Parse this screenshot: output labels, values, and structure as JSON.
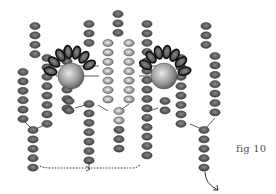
{
  "figure": {
    "caption": "fig 10",
    "caption_pos": {
      "x": 236,
      "y": 143
    },
    "colors": {
      "bead_dark_center": "#8a8a8a",
      "bead_dark_edge": "#3a3a3a",
      "bead_light_center": "#f2f2f2",
      "bead_light_edge": "#6e6e6e",
      "petal_outline": "#111111",
      "thread": "#333333",
      "background": "#ffffff"
    },
    "bead_size": {
      "rx": 5.2,
      "ry": 3.6
    },
    "columns": [
      {
        "name": "left-outer-column",
        "x": 23,
        "y_start": 72,
        "count": 6,
        "tone": "dark"
      },
      {
        "name": "left-top-column",
        "x": 35,
        "y_start": 26,
        "count": 4,
        "tone": "dark"
      },
      {
        "name": "left-inner-column",
        "x": 47,
        "y_start": 58,
        "count": 8,
        "tone": "dark"
      },
      {
        "name": "left-stem",
        "x": 33,
        "y_start": 130,
        "count": 5,
        "tone": "dark"
      },
      {
        "name": "left-mid-column",
        "x": 67,
        "y_start": 52,
        "count": 7,
        "tone": "dark"
      },
      {
        "name": "left-mid-stem",
        "x": 89,
        "y_start": 104,
        "count": 7,
        "tone": "dark"
      },
      {
        "name": "left-drop-under-bead",
        "x": 69,
        "y_start": 101,
        "count": 2,
        "tone": "dark"
      },
      {
        "name": "center-left-top-column",
        "x": 89,
        "y_start": 24,
        "count": 3,
        "tone": "dark"
      },
      {
        "name": "center-left-column",
        "x": 108,
        "y_start": 43,
        "count": 7,
        "tone": "light"
      },
      {
        "name": "center-top-column",
        "x": 118,
        "y_start": 14,
        "count": 3,
        "tone": "dark"
      },
      {
        "name": "center-right-column",
        "x": 129,
        "y_start": 43,
        "count": 7,
        "tone": "light"
      },
      {
        "name": "center-stem",
        "x": 119,
        "y_start": 111,
        "count": 5,
        "tone": "mixed"
      },
      {
        "name": "right-mid-top-column",
        "x": 147,
        "y_start": 24,
        "count": 3,
        "tone": "dark"
      },
      {
        "name": "right-mid-column",
        "x": 147,
        "y_start": 52,
        "count": 12,
        "tone": "dark"
      },
      {
        "name": "right-drop-under-bead",
        "x": 165,
        "y_start": 101,
        "count": 2,
        "tone": "dark"
      },
      {
        "name": "right-inner-column",
        "x": 181,
        "y_start": 58,
        "count": 8,
        "tone": "dark"
      },
      {
        "name": "right-top-column",
        "x": 206,
        "y_start": 26,
        "count": 3,
        "tone": "dark"
      },
      {
        "name": "right-outer-column",
        "x": 215,
        "y_start": 56,
        "count": 7,
        "tone": "dark"
      },
      {
        "name": "right-stem",
        "x": 204,
        "y_start": 130,
        "count": 5,
        "tone": "dark"
      }
    ],
    "large_beads": [
      {
        "name": "left-large-bead",
        "x": 71,
        "y": 76,
        "r": 13
      },
      {
        "name": "right-large-bead",
        "x": 164,
        "y": 76,
        "r": 13
      }
    ],
    "petal_arcs": [
      {
        "name": "left-petal-arc",
        "cx": 71,
        "cy": 76,
        "radius": 25,
        "count": 7,
        "start_deg": 195,
        "end_deg": 330
      },
      {
        "name": "right-petal-arc",
        "cx": 164,
        "cy": 76,
        "radius": 25,
        "count": 7,
        "start_deg": 210,
        "end_deg": 345
      }
    ],
    "dotted_path": {
      "x1": 40,
      "x2": 140,
      "y": 168,
      "arrow_x": 89
    },
    "exit_arrow": {
      "x": 205,
      "y_start": 178,
      "x_end": 218,
      "y_end": 190
    }
  }
}
